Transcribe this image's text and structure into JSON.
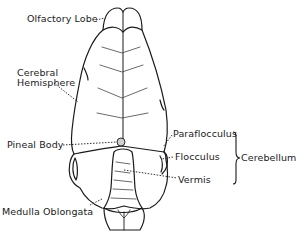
{
  "diagram": {
    "labels": {
      "olfactory_lobe": "Olfactory Lobe",
      "cerebral_hemisphere_line1": "Cerebral",
      "cerebral_hemisphere_line2": "Hemisphere",
      "pineal_body": "Pineal Body",
      "medulla_oblongata": "Medulla Oblongata",
      "paraflocculus": "Paraflocculus",
      "flocculus": "Flocculus",
      "vermis": "Vermis",
      "cerebellum": "Cerebellum"
    },
    "groups": [
      {
        "name": "Cerebellum",
        "members": [
          "Paraflocculus",
          "Flocculus",
          "Vermis"
        ]
      }
    ],
    "colors": {
      "line": "#1a1a1a",
      "pineal_fill": "#cfcfcf",
      "background": "#ffffff"
    }
  }
}
